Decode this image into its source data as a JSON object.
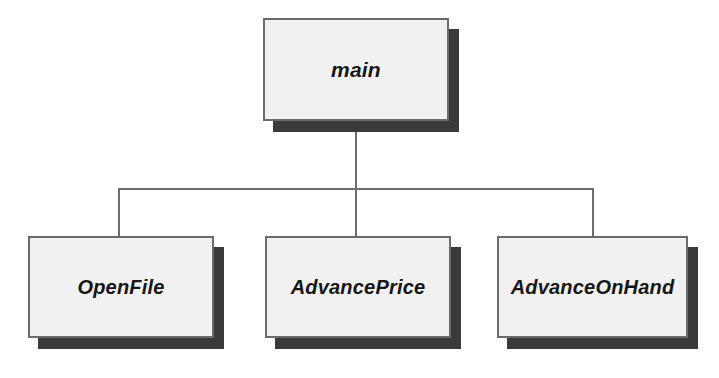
{
  "diagram": {
    "type": "structure-chart",
    "title": "",
    "root": {
      "id": "main",
      "label": "main"
    },
    "children": [
      {
        "id": "openfile",
        "label": "OpenFile"
      },
      {
        "id": "advanceprice",
        "label": "AdvancePrice"
      },
      {
        "id": "advanceonhand",
        "label": "AdvanceOnHand"
      }
    ],
    "colors": {
      "background": "#ffffff",
      "box_fill": "#f1f1f1",
      "box_border": "#6b6b6b",
      "box_shadow": "#3a3a3a",
      "connector": "#6e6e6e",
      "label_text": "#161616"
    }
  }
}
